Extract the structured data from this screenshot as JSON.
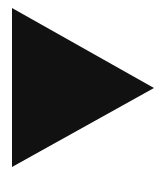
{
  "icon": {
    "semantic": "play-icon",
    "shape": "right-pointing-triangle",
    "fill_color": "#111111",
    "background_color": "#ffffff",
    "points": [
      [
        12,
        8
      ],
      [
        154,
        88
      ],
      [
        12,
        167
      ]
    ]
  }
}
